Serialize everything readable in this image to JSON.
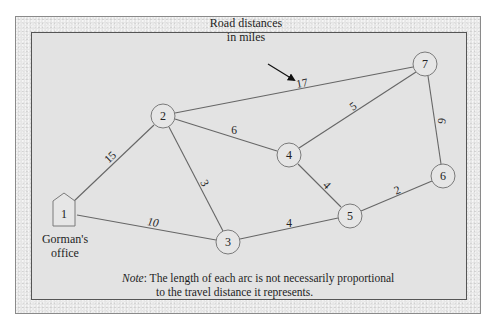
{
  "diagram": {
    "legend_text_line1": "Road distances",
    "legend_text_line2": "in miles",
    "office_label_line1": "Gorman's",
    "office_label_line2": "office",
    "note_key": "Note",
    "note_sep": ":",
    "note_line1": " The length of each arc is not necessarily proportional",
    "note_line2": "to the travel distance it represents.",
    "nodes": [
      {
        "id": "1",
        "label": "1",
        "shape": "house",
        "x": 64,
        "y": 214
      },
      {
        "id": "2",
        "label": "2",
        "shape": "circle",
        "x": 163,
        "y": 116
      },
      {
        "id": "3",
        "label": "3",
        "shape": "circle",
        "x": 228,
        "y": 242
      },
      {
        "id": "4",
        "label": "4",
        "shape": "circle",
        "x": 289,
        "y": 155
      },
      {
        "id": "5",
        "label": "5",
        "shape": "circle",
        "x": 350,
        "y": 216
      },
      {
        "id": "6",
        "label": "6",
        "shape": "circle",
        "x": 443,
        "y": 176
      },
      {
        "id": "7",
        "label": "7",
        "shape": "circle",
        "x": 425,
        "y": 64
      }
    ],
    "edges": [
      {
        "from": "1",
        "to": "2",
        "weight": "15"
      },
      {
        "from": "1",
        "to": "3",
        "weight": "10"
      },
      {
        "from": "2",
        "to": "3",
        "weight": "3"
      },
      {
        "from": "2",
        "to": "4",
        "weight": "6"
      },
      {
        "from": "2",
        "to": "7",
        "weight": "17"
      },
      {
        "from": "3",
        "to": "5",
        "weight": "4"
      },
      {
        "from": "4",
        "to": "5",
        "weight": "4"
      },
      {
        "from": "4",
        "to": "7",
        "weight": "5"
      },
      {
        "from": "5",
        "to": "6",
        "weight": "2"
      },
      {
        "from": "6",
        "to": "7",
        "weight": "6"
      }
    ]
  }
}
